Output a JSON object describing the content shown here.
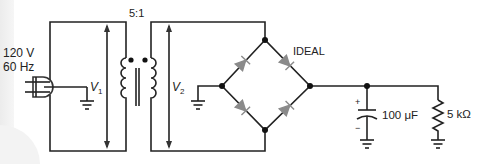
{
  "diagram": {
    "type": "full-wave bridge rectifier with capacitor-input filter",
    "source": {
      "voltage": "120 V",
      "frequency": "60 Hz"
    },
    "transformer": {
      "ratio": "5:1",
      "primary_label": "V",
      "primary_sub": "1",
      "secondary_label": "V",
      "secondary_sub": "2"
    },
    "bridge": {
      "label": "IDEAL"
    },
    "capacitor": {
      "value": "100 μF",
      "plus": "+",
      "minus": "−"
    },
    "resistor": {
      "value": "5 kΩ"
    }
  },
  "colors": {
    "wire": "#222222",
    "diode": "#8a8a8a",
    "background": "#ffffff",
    "band": "#efefef"
  }
}
